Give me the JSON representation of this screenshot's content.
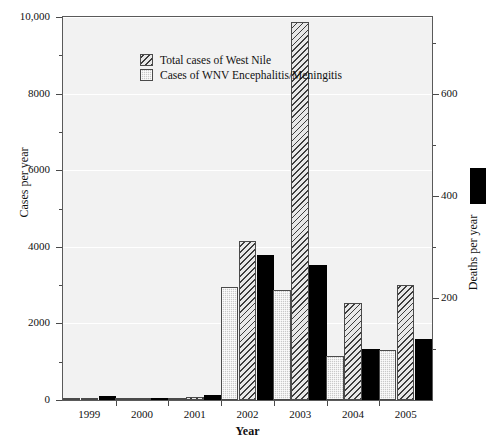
{
  "chart_data": {
    "type": "bar",
    "title": "",
    "xlabel": "Year",
    "ylabel": "Cases per year",
    "y2label": "Deaths per year",
    "categories": [
      "1999",
      "2000",
      "2001",
      "2002",
      "2003",
      "2004",
      "2005"
    ],
    "ylim": [
      0,
      10000
    ],
    "y2lim": [
      0,
      750
    ],
    "yticks": [
      "0",
      "2000",
      "4000",
      "6000",
      "8000",
      "10,000"
    ],
    "ytick_values": [
      0,
      2000,
      4000,
      6000,
      8000,
      10000
    ],
    "y2ticks": [
      "200",
      "400",
      "600"
    ],
    "y2tick_values": [
      200,
      400,
      600
    ],
    "grid": true,
    "legend_position": "upper-left-inside",
    "series": [
      {
        "name": "Cases of WNV Encephalitis/Meningitis",
        "axis": "left",
        "style": "light-gray-stippled",
        "values": [
          59,
          19,
          64,
          2946,
          2866,
          1148,
          1309
        ]
      },
      {
        "name": "Total cases of West Nile",
        "axis": "left",
        "style": "diagonal-hatch",
        "values": [
          62,
          21,
          66,
          4156,
          9862,
          2539,
          3000
        ]
      },
      {
        "name": "Deaths per year",
        "axis": "right",
        "style": "solid-black",
        "values": [
          7,
          2,
          9,
          284,
          264,
          100,
          119
        ]
      }
    ]
  },
  "legend": {
    "items": [
      {
        "label": "Total cases of West Nile",
        "swatch": "diagonal-hatch"
      },
      {
        "label": "Cases of WNV Encephalitis/Meningitis",
        "swatch": "light-gray-stippled"
      }
    ]
  },
  "right_legend": {
    "swatch": "solid-black",
    "label": "Deaths per year"
  }
}
